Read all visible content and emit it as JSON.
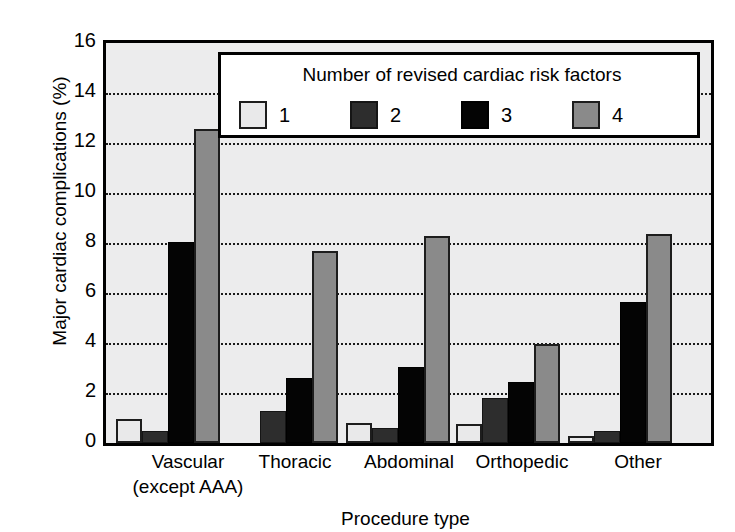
{
  "chart_data": {
    "type": "bar",
    "title": "",
    "xlabel": "Procedure type",
    "ylabel": "Major cardiac complications (%)",
    "ylim": [
      0,
      16
    ],
    "ytick_labels": [
      "16",
      "14",
      "12",
      "10",
      "8",
      "6",
      "4",
      "2",
      "0"
    ],
    "ytick_values": [
      16,
      14,
      12,
      10,
      8,
      6,
      4,
      2,
      0
    ],
    "grid": "horizontal dotted gridlines at 2,4,6,8,10,12,14",
    "legend_position": "inside top-center",
    "legend_title": "Number of revised cardiac risk factors",
    "categories": [
      "Vascular (except AAA)",
      "Thoracic",
      "Abdominal",
      "Orthopedic",
      "Other"
    ],
    "category_lines": [
      [
        "Vascular",
        "(except AAA)"
      ],
      [
        "Thoracic",
        ""
      ],
      [
        "Abdominal",
        ""
      ],
      [
        "Orthopedic",
        ""
      ],
      [
        "Other",
        ""
      ]
    ],
    "series": [
      {
        "name": "1",
        "color": "#e9e9ea",
        "values": [
          0.95,
          0.0,
          0.8,
          0.75,
          0.3
        ]
      },
      {
        "name": "2",
        "color": "#2d2d2d",
        "values": [
          0.5,
          1.3,
          0.6,
          1.8,
          0.5
        ]
      },
      {
        "name": "3",
        "color": "#040404",
        "values": [
          8.05,
          2.6,
          3.05,
          2.45,
          5.65
        ]
      },
      {
        "name": "4",
        "color": "#8a8a8a",
        "values": [
          12.55,
          7.7,
          8.3,
          3.95,
          8.35
        ]
      }
    ]
  },
  "colors": {
    "plot_background": "#ececed",
    "axis": "#000000",
    "gridline": "#1a1a1a",
    "legend_background": "#ffffff",
    "series_1": "#e9e9ea",
    "series_2": "#2d2d2d",
    "series_3": "#040404",
    "series_4": "#8a8a8a"
  }
}
